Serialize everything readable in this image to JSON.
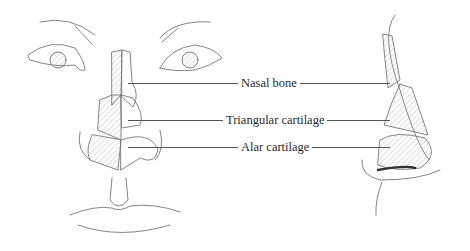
{
  "figure": {
    "views": [
      "frontal",
      "lateral"
    ],
    "labels": [
      {
        "text": "Nasal bone",
        "y": 83
      },
      {
        "text": "Triangular cartilage",
        "y": 120
      },
      {
        "text": "Alar cartilage",
        "y": 147
      }
    ],
    "colors": {
      "stroke": "#666666",
      "hatch": "#999999",
      "text": "#2a2a2a",
      "background": "#ffffff"
    }
  }
}
